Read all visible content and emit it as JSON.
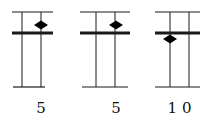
{
  "panels": [
    {
      "id": "panel-1",
      "label": "5",
      "x_left": 12,
      "x_right": 53,
      "bottom_left": 13,
      "bottom_right": 45,
      "vlines": [
        22,
        41
      ],
      "diamond": {
        "cx": 41,
        "cy": 25
      }
    },
    {
      "id": "panel-2",
      "label": "5",
      "x_left": 80,
      "x_right": 130,
      "bottom_left": 82,
      "bottom_right": 128,
      "vlines": [
        96,
        115
      ],
      "diamond": {
        "cx": 116,
        "cy": 25
      }
    },
    {
      "id": "panel-3",
      "label": "1 0",
      "x_left": 155,
      "x_right": 200,
      "bottom_left": 155,
      "bottom_right": 200,
      "vlines": [
        170,
        189
      ],
      "diamond": {
        "cx": 170,
        "cy": 39
      }
    }
  ],
  "layout": {
    "top_y": 12,
    "thick_y": 33,
    "bottom_y": 87,
    "label_y": 101
  },
  "colors": {
    "line": "#1a1a1a",
    "diamond": "#000000"
  }
}
